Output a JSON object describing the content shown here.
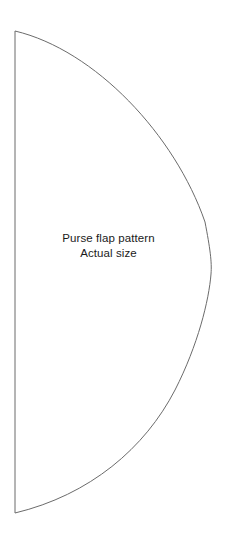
{
  "page": {
    "background_color": "#ffffff",
    "width": 231,
    "height": 540
  },
  "pattern": {
    "name": "purse-flap-pattern",
    "title": "Purse flap pattern",
    "size_note": "Actual size",
    "outline_color": "#6b6b6b",
    "fill_color": "#ffffff",
    "text_color": "#1a1a1a",
    "geometry": {
      "straight_edge_top": [
        15,
        31
      ],
      "straight_edge_bottom": [
        15,
        513
      ],
      "curve_apex": [
        211,
        272
      ]
    }
  },
  "label": {
    "line1": "Purse flap pattern",
    "line2": "Actual size"
  }
}
